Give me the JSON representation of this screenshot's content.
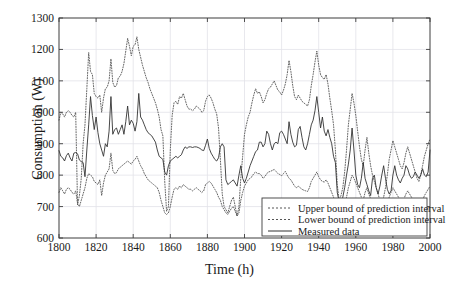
{
  "chart_data": {
    "type": "line",
    "title": "",
    "xlabel": "Time (h)",
    "ylabel": "Consumption (W)",
    "xlim": [
      1800,
      2000
    ],
    "ylim": [
      600,
      1300
    ],
    "xticks": [
      1800,
      1820,
      1840,
      1860,
      1880,
      1900,
      1920,
      1940,
      1960,
      1980,
      2000
    ],
    "yticks": [
      600,
      700,
      800,
      900,
      1000,
      1100,
      1200,
      1300
    ],
    "grid": true,
    "legend_position": "lower right",
    "x_start": 1800,
    "x_step": 1,
    "series": [
      {
        "name": "Upper bound of prediction interval",
        "style": "dotted",
        "color": "#555555",
        "values": [
          975,
          1000,
          995,
          985,
          1000,
          1005,
          1000,
          990,
          985,
          1000,
          705,
          735,
          790,
          900,
          960,
          1075,
          1190,
          1130,
          1120,
          1060,
          1050,
          1045,
          1055,
          1000,
          1045,
          1075,
          1080,
          1100,
          1170,
          1095,
          1080,
          1085,
          1110,
          1115,
          1130,
          1155,
          1195,
          1235,
          1210,
          1180,
          1210,
          1215,
          1240,
          1200,
          1175,
          1150,
          1130,
          1110,
          1095,
          1075,
          1060,
          1045,
          1030,
          1010,
          985,
          945,
          925,
          780,
          685,
          700,
          880,
          990,
          1030,
          1035,
          1025,
          1050,
          1045,
          1060,
          1040,
          1020,
          1010,
          1010,
          1005,
          1010,
          1020,
          1015,
          1010,
          1000,
          1005,
          1035,
          1050,
          1055,
          1045,
          1030,
          1010,
          995,
          950,
          850,
          740,
          700,
          690,
          680,
          700,
          720,
          730,
          700,
          670,
          700,
          790,
          860,
          930,
          960,
          985,
          1000,
          1030,
          1055,
          1075,
          1060,
          1065,
          1050,
          1030,
          1040,
          1060,
          1075,
          1080,
          1090,
          1100,
          1085,
          1070,
          1065,
          1055,
          1070,
          1090,
          1120,
          1165,
          1130,
          1085,
          1050,
          1040,
          1055,
          1045,
          1035,
          1030,
          1025,
          1020,
          1040,
          1085,
          1120,
          1160,
          1195,
          1150,
          1120,
          1110,
          1105,
          1120,
          1090,
          1045,
          1005,
          960,
          880,
          770,
          720,
          735,
          760,
          810,
          880,
          960,
          1010,
          1060,
          1030,
          990,
          940,
          890,
          850,
          830,
          880,
          920,
          870,
          830,
          800,
          780,
          760,
          740,
          720,
          710,
          730,
          760,
          800,
          850,
          880,
          910,
          890,
          870,
          850,
          830,
          820,
          840,
          870,
          890,
          870,
          850,
          830,
          810,
          790,
          780,
          800,
          830,
          860,
          880,
          900,
          915
        ]
      },
      {
        "name": "Lower bound of prediction interval",
        "style": "dotted",
        "color": "#555555",
        "values": [
          745,
          760,
          750,
          740,
          755,
          760,
          755,
          745,
          740,
          750,
          710,
          700,
          720,
          740,
          760,
          790,
          805,
          800,
          795,
          780,
          775,
          770,
          785,
          735,
          775,
          800,
          810,
          820,
          870,
          815,
          805,
          808,
          820,
          825,
          830,
          835,
          840,
          845,
          840,
          835,
          845,
          850,
          860,
          845,
          830,
          820,
          805,
          795,
          785,
          780,
          775,
          770,
          765,
          760,
          745,
          720,
          700,
          680,
          675,
          680,
          700,
          730,
          755,
          760,
          755,
          765,
          760,
          770,
          765,
          760,
          755,
          755,
          750,
          755,
          760,
          755,
          750,
          745,
          750,
          770,
          775,
          780,
          775,
          765,
          755,
          745,
          730,
          720,
          700,
          690,
          680,
          675,
          685,
          695,
          700,
          685,
          670,
          680,
          720,
          745,
          765,
          775,
          785,
          790,
          795,
          805,
          810,
          805,
          805,
          800,
          790,
          795,
          805,
          810,
          812,
          815,
          818,
          812,
          805,
          802,
          798,
          805,
          812,
          800,
          790,
          785,
          775,
          765,
          760,
          765,
          760,
          755,
          752,
          750,
          748,
          760,
          780,
          790,
          800,
          810,
          795,
          785,
          780,
          778,
          785,
          775,
          760,
          745,
          730,
          700,
          680,
          665,
          670,
          680,
          700,
          730,
          760,
          780,
          800,
          790,
          775,
          760,
          745,
          730,
          720,
          745,
          760,
          740,
          725,
          710,
          700,
          690,
          680,
          670,
          665,
          675,
          690,
          710,
          730,
          745,
          760,
          750,
          740,
          730,
          720,
          715,
          725,
          740,
          750,
          740,
          730,
          720,
          710,
          700,
          695,
          705,
          720,
          735,
          745,
          755,
          765
        ]
      },
      {
        "name": "Measured data",
        "style": "solid",
        "color": "#333333",
        "values": [
          878,
          860,
          855,
          845,
          862,
          870,
          855,
          845,
          870,
          872,
          868,
          848,
          843,
          840,
          795,
          880,
          960,
          1050,
          990,
          945,
          985,
          935,
          900,
          880,
          860,
          900,
          890,
          940,
          1050,
          930,
          945,
          950,
          930,
          945,
          960,
          930,
          970,
          1020,
          960,
          975,
          965,
          940,
          970,
          1060,
          985,
          975,
          960,
          945,
          935,
          930,
          925,
          915,
          905,
          880,
          860,
          855,
          850,
          810,
          800,
          830,
          845,
          850,
          855,
          860,
          855,
          860,
          865,
          880,
          890,
          885,
          890,
          890,
          888,
          890,
          890,
          888,
          885,
          880,
          878,
          895,
          915,
          885,
          870,
          860,
          850,
          845,
          855,
          890,
          900,
          890,
          785,
          770,
          775,
          780,
          785,
          775,
          765,
          800,
          830,
          790,
          775,
          790,
          810,
          830,
          845,
          860,
          875,
          880,
          905,
          905,
          890,
          900,
          940,
          930,
          900,
          880,
          900,
          905,
          900,
          935,
          940,
          930,
          915,
          900,
          970,
          930,
          905,
          890,
          895,
          945,
          955,
          920,
          890,
          880,
          900,
          930,
          960,
          975,
          1005,
          1050,
          1000,
          950,
          985,
          940,
          925,
          945,
          920,
          900,
          860,
          840,
          745,
          715,
          710,
          730,
          760,
          800,
          835,
          880,
          950,
          880,
          800,
          770,
          760,
          790,
          840,
          790,
          770,
          750,
          735,
          790,
          800,
          760,
          740,
          765,
          800,
          830,
          790,
          755,
          740,
          750,
          800,
          830,
          800,
          785,
          775,
          790,
          800,
          830,
          820,
          800,
          790,
          795,
          810,
          800,
          790,
          800,
          820,
          800,
          795,
          810,
          880
        ]
      }
    ]
  },
  "axes": {
    "x_title": "Time (h)",
    "y_title": "Consumption (W)"
  },
  "legend": {
    "entries": [
      {
        "label": "Upper bound of prediction interval",
        "style": "dotted"
      },
      {
        "label": "Lower bound of prediction interval",
        "style": "dotted"
      },
      {
        "label": "Measured data",
        "style": "solid"
      }
    ]
  },
  "colors": {
    "axis": "#3d3d3d",
    "grid": "#e2e2e8",
    "measured": "#333333",
    "bounds": "#555555",
    "text": "#1a1a1a",
    "background": "#ffffff"
  }
}
